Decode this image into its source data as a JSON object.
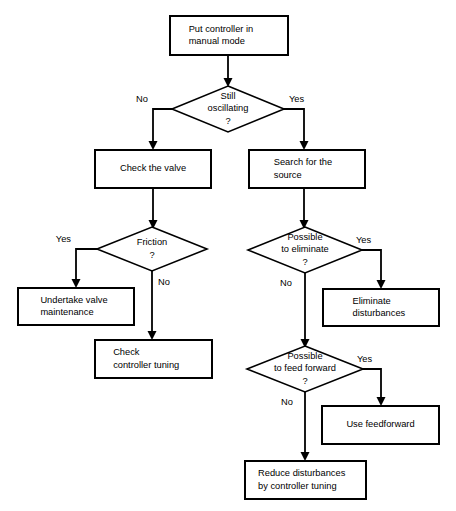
{
  "diagram": {
    "type": "flowchart",
    "background_color": "#ffffff",
    "line_color": "#000000",
    "node_fill": "#ffffff"
  },
  "nodes": [
    {
      "id": "put-controller-manual",
      "shape": "process",
      "lines": [
        "Put controller in",
        "manual mode"
      ],
      "align": "left",
      "x": 170,
      "y": 16,
      "w": 118,
      "h": 39
    },
    {
      "id": "still-oscillating",
      "shape": "decision",
      "lines": [
        "Still",
        "oscillating",
        "?"
      ],
      "align": "center",
      "cx": 228,
      "cy": 109,
      "rx": 56,
      "ry": 23
    },
    {
      "id": "check-the-valve",
      "shape": "process",
      "lines": [
        "Check the valve"
      ],
      "align": "center",
      "x": 95,
      "y": 150,
      "w": 116,
      "h": 38
    },
    {
      "id": "search-for-the-source",
      "shape": "process",
      "lines": [
        "Search for the",
        "source"
      ],
      "align": "left",
      "x": 249,
      "y": 150,
      "w": 116,
      "h": 38
    },
    {
      "id": "friction",
      "shape": "decision",
      "lines": [
        "Friction",
        "?"
      ],
      "align": "center",
      "cx": 152,
      "cy": 249,
      "rx": 55,
      "ry": 22
    },
    {
      "id": "possible-to-eliminate",
      "shape": "decision",
      "lines": [
        "Possible",
        "to eliminate",
        "?"
      ],
      "align": "center",
      "cx": 305,
      "cy": 250,
      "rx": 57,
      "ry": 23
    },
    {
      "id": "undertake-valve-maintenance",
      "shape": "process",
      "lines": [
        "Undertake valve",
        "maintenance"
      ],
      "align": "left",
      "x": 18,
      "y": 288,
      "w": 116,
      "h": 37
    },
    {
      "id": "eliminate-disturbances",
      "shape": "process",
      "lines": [
        "Eliminate",
        "disturbances"
      ],
      "align": "left",
      "x": 323,
      "y": 289,
      "w": 116,
      "h": 37
    },
    {
      "id": "check-controller-tuning",
      "shape": "process",
      "lines": [
        "Check",
        "controller tuning"
      ],
      "align": "left",
      "x": 95,
      "y": 340,
      "w": 117,
      "h": 38
    },
    {
      "id": "possible-to-feed-forward",
      "shape": "decision",
      "lines": [
        "Possible",
        "to feed forward",
        "?"
      ],
      "align": "center",
      "cx": 305,
      "cy": 369,
      "rx": 58,
      "ry": 23
    },
    {
      "id": "use-feedforward",
      "shape": "process",
      "lines": [
        "Use feedforward"
      ],
      "align": "center",
      "x": 322,
      "y": 406,
      "w": 117,
      "h": 38
    },
    {
      "id": "reduce-disturbances",
      "shape": "process",
      "lines": [
        "Reduce disturbances",
        "by controller tuning"
      ],
      "align": "left",
      "x": 245,
      "y": 461,
      "w": 121,
      "h": 38
    }
  ],
  "connectors": [
    {
      "id": "manual-to-oscillating",
      "points": "228,55 228,85",
      "arrow_at": "228,86",
      "arrow_dir": "down"
    },
    {
      "id": "oscillating-no-to-check-valve",
      "points": "172,109 153,109 153,147",
      "arrow_at": "153,149",
      "arrow_dir": "down"
    },
    {
      "id": "oscillating-yes-to-search-source",
      "points": "284,109 304,109 304,147",
      "arrow_at": "304,149",
      "arrow_dir": "down"
    },
    {
      "id": "check-valve-to-friction",
      "points": "153,188 153,226",
      "arrow_at": "153,228",
      "arrow_dir": "down"
    },
    {
      "id": "search-source-to-possible-eliminate",
      "points": "304,188 304,226",
      "arrow_at": "304,228",
      "arrow_dir": "down"
    },
    {
      "id": "friction-yes-to-maintenance",
      "points": "97,249 76,249 76,285",
      "arrow_at": "76,287",
      "arrow_dir": "down"
    },
    {
      "id": "friction-no-to-check-tuning",
      "points": "152,271 152,337",
      "arrow_at": "152,339",
      "arrow_dir": "down"
    },
    {
      "id": "eliminate-yes-to-eliminate-disturbances",
      "points": "362,250 381,250 381,286",
      "arrow_at": "381,288",
      "arrow_dir": "down"
    },
    {
      "id": "eliminate-no-to-feed-forward",
      "points": "305,273 305,345",
      "arrow_at": "305,347",
      "arrow_dir": "down"
    },
    {
      "id": "feedforward-yes-to-use-feedforward",
      "points": "363,369 381,369 381,403",
      "arrow_at": "381,405",
      "arrow_dir": "down"
    },
    {
      "id": "feedforward-no-to-reduce-disturbances",
      "points": "305,392 305,458",
      "arrow_at": "305,460",
      "arrow_dir": "down"
    }
  ],
  "edge_labels": [
    {
      "id": "label-oscillating-no",
      "text": "No",
      "x": 148,
      "y": 100,
      "anchor": "end"
    },
    {
      "id": "label-oscillating-yes",
      "text": "Yes",
      "x": 289,
      "y": 100,
      "anchor": "start"
    },
    {
      "id": "label-friction-yes",
      "text": "Yes",
      "x": 71,
      "y": 240,
      "anchor": "end"
    },
    {
      "id": "label-friction-no",
      "text": "No",
      "x": 158,
      "y": 283,
      "anchor": "start"
    },
    {
      "id": "label-eliminate-yes",
      "text": "Yes",
      "x": 356,
      "y": 241,
      "anchor": "start"
    },
    {
      "id": "label-eliminate-no",
      "text": "No",
      "x": 280,
      "y": 284,
      "anchor": "start"
    },
    {
      "id": "label-feedforward-yes",
      "text": "Yes",
      "x": 357,
      "y": 360,
      "anchor": "start"
    },
    {
      "id": "label-feedforward-no",
      "text": "No",
      "x": 281,
      "y": 403,
      "anchor": "start"
    }
  ]
}
